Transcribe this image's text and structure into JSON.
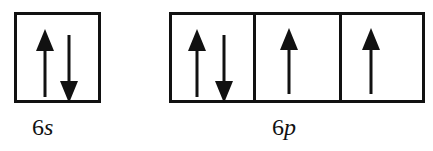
{
  "diagram": {
    "type": "orbital-box-diagram",
    "subshells": [
      {
        "label_n": "6",
        "label_l": "s",
        "orbitals": [
          {
            "electrons": [
              "up",
              "down"
            ]
          }
        ]
      },
      {
        "label_n": "6",
        "label_l": "p",
        "orbitals": [
          {
            "electrons": [
              "up",
              "down"
            ]
          },
          {
            "electrons": [
              "up"
            ]
          },
          {
            "electrons": [
              "up"
            ]
          }
        ]
      }
    ]
  }
}
